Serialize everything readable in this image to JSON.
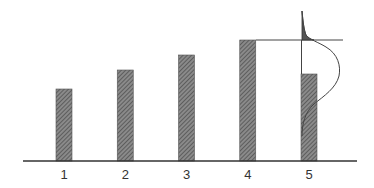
{
  "chart_data": {
    "type": "bar",
    "title": "",
    "xlabel": "",
    "ylabel": "",
    "categories": [
      "1",
      "2",
      "3",
      "4",
      "5"
    ],
    "values": [
      72,
      91,
      106,
      121,
      87
    ],
    "ylim": [
      0,
      150
    ],
    "grid": false,
    "legend": null,
    "annotations": [
      {
        "type": "hline",
        "description": "horizontal reference line at level of bar 4, extending right past bar 5",
        "y": 121
      },
      {
        "type": "vline",
        "description": "vertical line from bar 5 top up to reference line",
        "x": "5"
      },
      {
        "type": "distribution-curve",
        "description": "bell-shaped probability density drawn sideways over bar 5, with shaded upper tail above the reference line"
      }
    ],
    "colors": {
      "bar_fill": "#7a7a7a",
      "axis": "#333333",
      "tail_fill": "#555555",
      "line": "#444444"
    }
  }
}
